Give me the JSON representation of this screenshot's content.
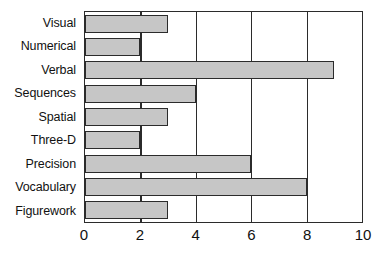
{
  "chart_data": {
    "type": "bar",
    "orientation": "horizontal",
    "title": "",
    "subtitle": "",
    "xlabel": "",
    "ylabel": "",
    "categories": [
      "Visual",
      "Numerical",
      "Verbal",
      "Sequences",
      "Spatial",
      "Three-D",
      "Precision",
      "Vocabulary",
      "Figurework"
    ],
    "values": [
      3,
      2,
      9,
      4,
      3,
      2,
      6,
      8,
      3
    ],
    "xlim": [
      0,
      10
    ],
    "xticks": [
      0,
      2,
      4,
      6,
      8,
      10
    ],
    "xtick_labels": [
      "0",
      "2",
      "4",
      "6",
      "8",
      "10"
    ],
    "grid": "vertical",
    "legend": "none",
    "bar_fill_color": "#c6c6c6",
    "bar_edge_color": "#2b2b2b",
    "axis_color": "#2b2b2b",
    "background_color": "#ffffff"
  }
}
